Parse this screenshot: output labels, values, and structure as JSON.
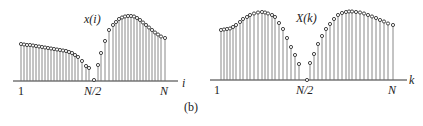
{
  "figure": {
    "caption": "(b)"
  },
  "chart_data": [
    {
      "type": "stem",
      "title": "x(i)",
      "xlabel": "i",
      "tick_labels": [
        "1",
        "N/2",
        "N"
      ],
      "axis": {
        "x_start": 13,
        "x_end": 178,
        "y": 81
      },
      "title_pos": {
        "x": 84,
        "y": 13
      },
      "xlabel_pos": {
        "x": 182,
        "y": 77
      },
      "ticks_pos": [
        {
          "x": 18,
          "y": 85
        },
        {
          "x": 84,
          "y": 85
        },
        {
          "x": 160,
          "y": 85
        }
      ],
      "points": [
        [
          21,
          44
        ],
        [
          24,
          44.5
        ],
        [
          27,
          45
        ],
        [
          30,
          45
        ],
        [
          33,
          45.5
        ],
        [
          36,
          46
        ],
        [
          39,
          46.5
        ],
        [
          42,
          47
        ],
        [
          45,
          47.5
        ],
        [
          48,
          48
        ],
        [
          51,
          48.5
        ],
        [
          54,
          49
        ],
        [
          57,
          49.5
        ],
        [
          60,
          50
        ],
        [
          63,
          50.5
        ],
        [
          66,
          51
        ],
        [
          69,
          52
        ],
        [
          72,
          53
        ],
        [
          75,
          55
        ],
        [
          78,
          57
        ],
        [
          82,
          61
        ],
        [
          86,
          66
        ],
        [
          89,
          68
        ],
        [
          94,
          80
        ],
        [
          98,
          65
        ],
        [
          101,
          53
        ],
        [
          105,
          41
        ],
        [
          109,
          30
        ],
        [
          113,
          25
        ],
        [
          116,
          22
        ],
        [
          119,
          19
        ],
        [
          122,
          17.5
        ],
        [
          125,
          16.5
        ],
        [
          128,
          16
        ],
        [
          131,
          16
        ],
        [
          134,
          16.5
        ],
        [
          137,
          18
        ],
        [
          140,
          20
        ],
        [
          143,
          22.5
        ],
        [
          146,
          25
        ],
        [
          149,
          27.5
        ],
        [
          152,
          30
        ],
        [
          155,
          32.5
        ],
        [
          158,
          34.5
        ],
        [
          161,
          36.5
        ],
        [
          165,
          38
        ]
      ],
      "description": "Time-domain sequence: slowly decaying segment for i<N/2, dip to zero at N/2, large hump for i>N/2"
    },
    {
      "type": "stem",
      "title": "X(k)",
      "xlabel": "k",
      "tick_labels": [
        "1",
        "N/2",
        "N"
      ],
      "axis": {
        "x_start": 210,
        "x_end": 407,
        "y": 80
      },
      "title_pos": {
        "x": 296,
        "y": 12
      },
      "xlabel_pos": {
        "x": 409,
        "y": 74
      },
      "ticks_pos": [
        {
          "x": 214,
          "y": 84
        },
        {
          "x": 296,
          "y": 84
        },
        {
          "x": 388,
          "y": 84
        }
      ],
      "points": [
        [
          221,
          30
        ],
        [
          224,
          29.5
        ],
        [
          227,
          29
        ],
        [
          230,
          28.5
        ],
        [
          233,
          27
        ],
        [
          236,
          25
        ],
        [
          240,
          22
        ],
        [
          243,
          19
        ],
        [
          247,
          17
        ],
        [
          250,
          15
        ],
        [
          254,
          13.5
        ],
        [
          258,
          12.5
        ],
        [
          262,
          12
        ],
        [
          265,
          12.5
        ],
        [
          268,
          13.5
        ],
        [
          272,
          15
        ],
        [
          275,
          17
        ],
        [
          279,
          23
        ],
        [
          283,
          29
        ],
        [
          287,
          38
        ],
        [
          291,
          47
        ],
        [
          295,
          55
        ],
        [
          299,
          64
        ],
        [
          307,
          80
        ],
        [
          310,
          63
        ],
        [
          314,
          54
        ],
        [
          318,
          44
        ],
        [
          322,
          36
        ],
        [
          326,
          29
        ],
        [
          330,
          24
        ],
        [
          334,
          19
        ],
        [
          338,
          15
        ],
        [
          342,
          13
        ],
        [
          346,
          12
        ],
        [
          349,
          11.5
        ],
        [
          352,
          11.5
        ],
        [
          356,
          12
        ],
        [
          360,
          12.5
        ],
        [
          364,
          13.5
        ],
        [
          368,
          15
        ],
        [
          372,
          16.5
        ],
        [
          376,
          18
        ],
        [
          380,
          20
        ],
        [
          384,
          21.5
        ],
        [
          388,
          23.5
        ],
        [
          393,
          25
        ]
      ],
      "description": "Frequency-domain sequence: symmetric double-humped magnitude with zero at N/2"
    }
  ]
}
